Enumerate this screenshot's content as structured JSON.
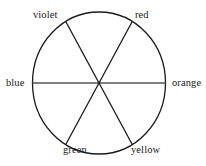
{
  "figure": {
    "kind": "color-wheel-diagram",
    "background_color": "#ffffff",
    "stroke_color": "#1a1a1a",
    "text_color": "#1a1a1a"
  },
  "wheel": {
    "center": {
      "x": 99,
      "y": 83
    },
    "radius_x": 66.5,
    "radius_y": 71,
    "sector_count": 6,
    "spoke_angles_deg": [
      0,
      60,
      120,
      180,
      240,
      300
    ],
    "labels": [
      {
        "id": "violet",
        "text": "violet",
        "position": "upper-left",
        "angle_deg": 120
      },
      {
        "id": "red",
        "text": "red",
        "position": "upper-right",
        "angle_deg": 60
      },
      {
        "id": "orange",
        "text": "orange",
        "position": "right",
        "angle_deg": 0
      },
      {
        "id": "yellow",
        "text": "yellow",
        "position": "lower-right",
        "angle_deg": 300
      },
      {
        "id": "green",
        "text": "green",
        "position": "lower-left",
        "angle_deg": 240
      },
      {
        "id": "blue",
        "text": "blue",
        "position": "left",
        "angle_deg": 180
      }
    ]
  }
}
